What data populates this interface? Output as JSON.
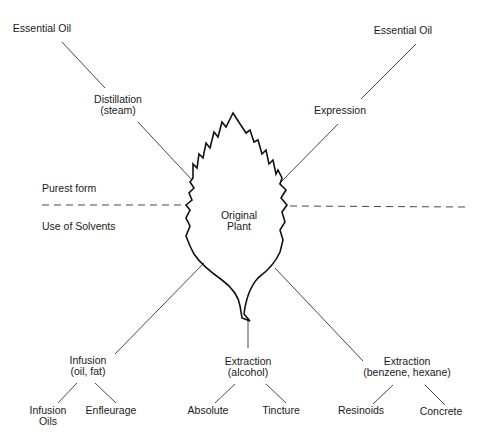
{
  "diagram": {
    "center": {
      "line1": "Original",
      "line2": "Plant"
    },
    "zones": {
      "upper": "Purest form",
      "lower": "Use of Solvents"
    },
    "nodes": {
      "essential_oil_left": "Essential Oil",
      "essential_oil_right": "Essential Oil",
      "distillation": {
        "line1": "Distillation",
        "line2": "(steam)"
      },
      "expression": "Expression",
      "infusion": {
        "line1": "Infusion",
        "line2": "(oil, fat)"
      },
      "extraction_alcohol": {
        "line1": "Extraction",
        "line2": "(alcohol)"
      },
      "extraction_solvent": {
        "line1": "Extraction",
        "line2": "(benzene, hexane)"
      },
      "infusion_oils": {
        "line1": "Infusion",
        "line2": "Oils"
      },
      "enfleurage": "Enfleurage",
      "absolute": "Absolute",
      "tincture": "Tincture",
      "resinoids": "Resinoids",
      "concrete": "Concrete"
    },
    "colors": {
      "line": "#333333",
      "leaf": "#111111",
      "text": "#1a1a1a",
      "background": "#ffffff"
    }
  }
}
